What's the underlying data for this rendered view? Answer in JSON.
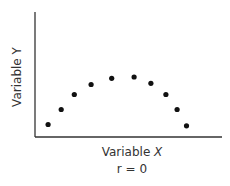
{
  "chart_data": {
    "type": "scatter",
    "title": "",
    "xlabel": "Variable X",
    "ylabel": "Variable Y",
    "annotation": "r = 0",
    "grid": false,
    "legend": null,
    "ticks": {
      "x": [],
      "y": []
    },
    "xlim": [
      0,
      10
    ],
    "ylim": [
      0,
      10
    ],
    "points": [
      {
        "x": 0.7,
        "y": 1.0
      },
      {
        "x": 1.4,
        "y": 2.2
      },
      {
        "x": 2.1,
        "y": 3.4
      },
      {
        "x": 3.0,
        "y": 4.2
      },
      {
        "x": 4.1,
        "y": 4.7
      },
      {
        "x": 5.3,
        "y": 4.8
      },
      {
        "x": 6.2,
        "y": 4.3
      },
      {
        "x": 7.0,
        "y": 3.4
      },
      {
        "x": 7.6,
        "y": 2.2
      },
      {
        "x": 8.1,
        "y": 0.9
      }
    ],
    "point_color": "#111111",
    "axis_color": "#333333"
  },
  "labels": {
    "x_prefix": "Variable",
    "x_var": "X",
    "y_label": "Variable Y",
    "r_label": "r = 0"
  }
}
